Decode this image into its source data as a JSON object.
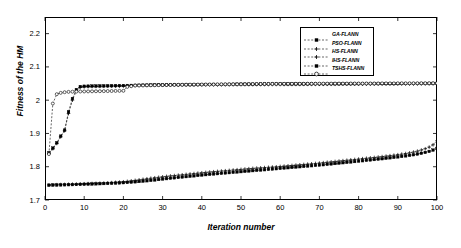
{
  "chart_data": {
    "type": "line",
    "title": "",
    "xlabel": "Iteration number",
    "ylabel": "Fitness of the HM",
    "xlim": [
      0,
      100
    ],
    "ylim": [
      1.7,
      2.25
    ],
    "xticks": [
      0,
      10,
      20,
      30,
      40,
      50,
      60,
      70,
      80,
      90,
      100
    ],
    "xtick_labels": [
      "0",
      "10",
      "20",
      "30",
      "40",
      "50",
      "60",
      "70",
      "80",
      "90",
      "100"
    ],
    "yticks": [
      1.7,
      1.8,
      1.9,
      2.0,
      2.1,
      2.2
    ],
    "ytick_labels": [
      "1.7",
      "1.8",
      "1.9",
      "2",
      "2.1",
      "2.2"
    ],
    "grid": false,
    "legend_position": "upper right",
    "legend_entries": [
      "GA-FLANN",
      "PSO-FLANN",
      "HS-FLANN",
      "IHS-FLANN",
      "TSHS-FLANN"
    ],
    "x": [
      1,
      2,
      3,
      4,
      5,
      6,
      7,
      8,
      9,
      10,
      11,
      12,
      13,
      14,
      15,
      16,
      17,
      18,
      19,
      20,
      21,
      22,
      23,
      24,
      25,
      26,
      27,
      28,
      29,
      30,
      31,
      32,
      33,
      34,
      35,
      36,
      37,
      38,
      39,
      40,
      41,
      42,
      43,
      44,
      45,
      46,
      47,
      48,
      49,
      50,
      51,
      52,
      53,
      54,
      55,
      56,
      57,
      58,
      59,
      60,
      61,
      62,
      63,
      64,
      65,
      66,
      67,
      68,
      69,
      70,
      71,
      72,
      73,
      74,
      75,
      76,
      77,
      78,
      79,
      80,
      81,
      82,
      83,
      84,
      85,
      86,
      87,
      88,
      89,
      90,
      91,
      92,
      93,
      94,
      95,
      96,
      97,
      98,
      99,
      100
    ],
    "series": [
      {
        "name": "GA-FLANN",
        "marker": "square",
        "linestyle": "dashed",
        "values": [
          1.7445,
          1.745,
          1.7452,
          1.7455,
          1.7458,
          1.746,
          1.7462,
          1.7466,
          1.747,
          1.7474,
          1.7478,
          1.7482,
          1.7486,
          1.749,
          1.7494,
          1.7498,
          1.7503,
          1.7508,
          1.7514,
          1.752,
          1.7528,
          1.7536,
          1.7546,
          1.7556,
          1.7566,
          1.7578,
          1.759,
          1.7602,
          1.7616,
          1.763,
          1.7642,
          1.7654,
          1.7666,
          1.7678,
          1.769,
          1.7702,
          1.7714,
          1.7726,
          1.7738,
          1.775,
          1.7762,
          1.7772,
          1.7782,
          1.7792,
          1.7802,
          1.7812,
          1.7822,
          1.7832,
          1.7842,
          1.7852,
          1.7862,
          1.7872,
          1.7882,
          1.7892,
          1.79,
          1.791,
          1.792,
          1.793,
          1.794,
          1.795,
          1.796,
          1.797,
          1.798,
          1.799,
          1.8,
          1.801,
          1.802,
          1.803,
          1.804,
          1.805,
          1.806,
          1.8072,
          1.8084,
          1.8096,
          1.8108,
          1.812,
          1.8132,
          1.8144,
          1.8156,
          1.8168,
          1.818,
          1.8192,
          1.8204,
          1.8216,
          1.8228,
          1.824,
          1.8254,
          1.8268,
          1.8282,
          1.8296,
          1.831,
          1.8326,
          1.8342,
          1.836,
          1.838,
          1.8404,
          1.843,
          1.846,
          1.85,
          1.855
        ]
      },
      {
        "name": "PSO-FLANN",
        "marker": "plus",
        "linestyle": "dashed",
        "values": [
          1.7452,
          1.7456,
          1.746,
          1.7464,
          1.7468,
          1.7472,
          1.7476,
          1.748,
          1.7484,
          1.7488,
          1.7492,
          1.7496,
          1.75,
          1.7504,
          1.751,
          1.7516,
          1.7522,
          1.753,
          1.7538,
          1.7548,
          1.756,
          1.7574,
          1.759,
          1.7606,
          1.7622,
          1.7638,
          1.7654,
          1.7668,
          1.7682,
          1.7696,
          1.771,
          1.7722,
          1.7734,
          1.7746,
          1.7758,
          1.777,
          1.7782,
          1.7794,
          1.7806,
          1.7818,
          1.783,
          1.784,
          1.785,
          1.786,
          1.787,
          1.788,
          1.789,
          1.79,
          1.791,
          1.792,
          1.793,
          1.794,
          1.795,
          1.7958,
          1.7966,
          1.7974,
          1.7982,
          1.799,
          1.7998,
          1.8008,
          1.8018,
          1.8028,
          1.8038,
          1.8048,
          1.8058,
          1.8068,
          1.8078,
          1.8088,
          1.8098,
          1.811,
          1.8122,
          1.8134,
          1.8146,
          1.8158,
          1.817,
          1.8182,
          1.8194,
          1.8206,
          1.8218,
          1.823,
          1.8242,
          1.8254,
          1.8266,
          1.8278,
          1.829,
          1.8304,
          1.8318,
          1.8332,
          1.8346,
          1.8362,
          1.8378,
          1.8396,
          1.8416,
          1.844,
          1.8468,
          1.8502,
          1.854,
          1.859,
          1.866,
          1.878
        ]
      },
      {
        "name": "HS-FLANN",
        "marker": "plus",
        "linestyle": "dashed",
        "values": [
          1.84,
          1.854,
          1.87,
          1.89,
          1.908,
          1.96,
          2.0,
          2.028,
          2.038,
          2.04,
          2.0408,
          2.0412,
          2.0414,
          2.0416,
          2.0418,
          2.042,
          2.042,
          2.0422,
          2.0422,
          2.0424,
          2.0424,
          2.0426,
          2.044,
          2.0442,
          2.0444,
          2.0446,
          2.0448,
          2.0448,
          2.045,
          2.045,
          2.0452,
          2.0452,
          2.0454,
          2.0454,
          2.0456,
          2.0456,
          2.0458,
          2.0458,
          2.046,
          2.046,
          2.046,
          2.0462,
          2.0462,
          2.0462,
          2.0464,
          2.0464,
          2.0464,
          2.0466,
          2.0466,
          2.0466,
          2.0468,
          2.0468,
          2.0468,
          2.047,
          2.047,
          2.047,
          2.047,
          2.0472,
          2.0472,
          2.0472,
          2.0472,
          2.0474,
          2.0474,
          2.0474,
          2.0474,
          2.0476,
          2.0476,
          2.0476,
          2.0476,
          2.0478,
          2.0478,
          2.0478,
          2.0478,
          2.0478,
          2.048,
          2.048,
          2.048,
          2.048,
          2.048,
          2.0482,
          2.0482,
          2.0482,
          2.0482,
          2.0482,
          2.0484,
          2.0484,
          2.0484,
          2.0484,
          2.0484,
          2.0486,
          2.0486,
          2.0486,
          2.0486,
          2.0486,
          2.0488,
          2.0488,
          2.0488,
          2.0488,
          2.049,
          2.049
        ]
      },
      {
        "name": "IHS-FLANN",
        "marker": "square",
        "linestyle": "dashed",
        "values": [
          1.842,
          1.856,
          1.872,
          1.892,
          1.91,
          1.965,
          2.005,
          2.032,
          2.041,
          2.042,
          2.0422,
          2.0424,
          2.0426,
          2.0428,
          2.043,
          2.0432,
          2.0434,
          2.0436,
          2.0438,
          2.044,
          2.0442,
          2.0444,
          2.0446,
          2.0448,
          2.045,
          2.0452,
          2.0454,
          2.0456,
          2.0458,
          2.046,
          2.0462,
          2.0462,
          2.0464,
          2.0464,
          2.0466,
          2.0466,
          2.0468,
          2.0468,
          2.047,
          2.047,
          2.0472,
          2.0472,
          2.0474,
          2.0474,
          2.0476,
          2.0476,
          2.0478,
          2.0478,
          2.048,
          2.048,
          2.048,
          2.0482,
          2.0482,
          2.0482,
          2.0484,
          2.0484,
          2.0484,
          2.0486,
          2.0486,
          2.0486,
          2.0488,
          2.0488,
          2.0488,
          2.049,
          2.049,
          2.049,
          2.049,
          2.0492,
          2.0492,
          2.0492,
          2.0492,
          2.0494,
          2.0494,
          2.0494,
          2.0494,
          2.0496,
          2.0496,
          2.0496,
          2.0496,
          2.0496,
          2.0498,
          2.0498,
          2.0498,
          2.0498,
          2.0498,
          2.05,
          2.05,
          2.05,
          2.05,
          2.05,
          2.0502,
          2.0502,
          2.0502,
          2.0502,
          2.0502,
          2.0504,
          2.0504,
          2.0504,
          2.0504,
          2.0504
        ]
      },
      {
        "name": "TSHS-FLANN",
        "marker": "circle",
        "linestyle": "dashed",
        "values": [
          1.838,
          1.99,
          2.018,
          2.022,
          2.024,
          2.025,
          2.0255,
          2.0258,
          2.026,
          2.0262,
          2.0264,
          2.0266,
          2.0268,
          2.027,
          2.0272,
          2.0274,
          2.0276,
          2.0278,
          2.028,
          2.0282,
          2.04,
          2.042,
          2.044,
          2.0442,
          2.0444,
          2.0446,
          2.0448,
          2.045,
          2.0452,
          2.0454,
          2.0456,
          2.0458,
          2.046,
          2.0462,
          2.0464,
          2.0466,
          2.0468,
          2.047,
          2.047,
          2.0472,
          2.0472,
          2.0474,
          2.0474,
          2.0476,
          2.0476,
          2.0478,
          2.0478,
          2.048,
          2.048,
          2.0482,
          2.0482,
          2.0484,
          2.0484,
          2.0486,
          2.0486,
          2.0488,
          2.0488,
          2.049,
          2.049,
          2.049,
          2.0492,
          2.0492,
          2.0492,
          2.0494,
          2.0494,
          2.0494,
          2.0496,
          2.0496,
          2.0496,
          2.0498,
          2.0498,
          2.0498,
          2.0498,
          2.05,
          2.05,
          2.05,
          2.05,
          2.0502,
          2.0502,
          2.0502,
          2.0502,
          2.0504,
          2.0504,
          2.0504,
          2.0504,
          2.0506,
          2.0506,
          2.0506,
          2.0506,
          2.0508,
          2.0508,
          2.0508,
          2.0508,
          2.051,
          2.051,
          2.051,
          2.051,
          2.0512,
          2.0512,
          2.0512
        ]
      }
    ]
  }
}
